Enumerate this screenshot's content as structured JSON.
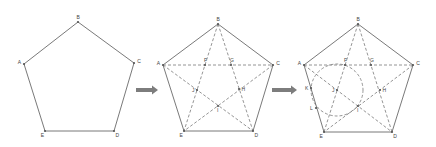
{
  "figure": {
    "colors": {
      "edge": "#6a6a6a",
      "dashed": "#7a7a7a",
      "arrow": "#7d7d7d",
      "background": "#ffffff"
    },
    "panels": [
      {
        "id": "step1",
        "vertices": [
          {
            "name": "A",
            "x": 24,
            "y": 64
          },
          {
            "name": "B",
            "x": 78,
            "y": 22
          },
          {
            "name": "C",
            "x": 134,
            "y": 63
          },
          {
            "name": "D",
            "x": 114,
            "y": 131
          },
          {
            "name": "E",
            "x": 45,
            "y": 131
          }
        ],
        "intersections": [],
        "extra_points": [],
        "has_diagonals": false,
        "has_arc": false
      },
      {
        "id": "step2",
        "vertices": [
          {
            "name": "A",
            "x": 163,
            "y": 65
          },
          {
            "name": "B",
            "x": 218,
            "y": 24
          },
          {
            "name": "C",
            "x": 273,
            "y": 65
          },
          {
            "name": "D",
            "x": 253,
            "y": 131
          },
          {
            "name": "E",
            "x": 184,
            "y": 131
          }
        ],
        "intersections": [
          {
            "name": "F",
            "x": 205,
            "y": 65
          },
          {
            "name": "G",
            "x": 231,
            "y": 65
          },
          {
            "name": "H",
            "x": 239,
            "y": 89
          },
          {
            "name": "I",
            "x": 218,
            "y": 106
          },
          {
            "name": "J",
            "x": 197,
            "y": 90
          }
        ],
        "extra_points": [],
        "has_diagonals": true,
        "has_arc": false
      },
      {
        "id": "step3",
        "vertices": [
          {
            "name": "A",
            "x": 304,
            "y": 65
          },
          {
            "name": "B",
            "x": 358,
            "y": 24
          },
          {
            "name": "C",
            "x": 413,
            "y": 65
          },
          {
            "name": "D",
            "x": 392,
            "y": 132
          },
          {
            "name": "E",
            "x": 324,
            "y": 132
          }
        ],
        "intersections": [
          {
            "name": "F",
            "x": 345,
            "y": 65
          },
          {
            "name": "G",
            "x": 371,
            "y": 65
          },
          {
            "name": "H",
            "x": 380,
            "y": 90
          },
          {
            "name": "I",
            "x": 358,
            "y": 106
          },
          {
            "name": "J",
            "x": 337,
            "y": 90
          }
        ],
        "extra_points": [
          {
            "name": "K",
            "x": 311,
            "y": 88
          },
          {
            "name": "L",
            "x": 316,
            "y": 108
          }
        ],
        "has_diagonals": true,
        "has_arc": true,
        "arc": {
          "cx": 337,
          "cy": 90,
          "r": 26
        }
      }
    ],
    "arrows": [
      {
        "from_x": 136,
        "to_x": 158,
        "y": 90
      },
      {
        "from_x": 272,
        "to_x": 297,
        "y": 90
      }
    ]
  }
}
